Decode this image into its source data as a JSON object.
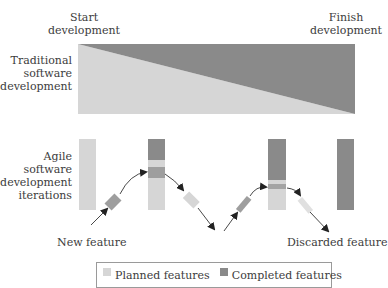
{
  "colors": {
    "planned": "#d6d6d6",
    "completed": "#8a8a8a",
    "arrow": "#333333",
    "legend_border": "#9a9a9a"
  },
  "labels": {
    "start": "Start\ndevelopment",
    "start_line1": "Start",
    "start_line2": "development",
    "finish_line1": "Finish",
    "finish_line2": "development",
    "traditional_line1": "Traditional",
    "traditional_line2": "software",
    "traditional_line3": "development",
    "agile_line1": "Agile",
    "agile_line2": "software",
    "agile_line3": "development",
    "agile_line4": "iterations",
    "new_feature": "New feature",
    "discarded_feature": "Discarded feature"
  },
  "legend": {
    "items": [
      {
        "label": "Planned features",
        "color": "#d6d6d6"
      },
      {
        "label": "Completed features",
        "color": "#8a8a8a"
      }
    ]
  },
  "traditional": {
    "box": {
      "x": 78,
      "y": 44,
      "w": 277,
      "h": 70
    },
    "description": "Completed work grows linearly from start to finish (dark triangle above diagonal)"
  },
  "agile": {
    "iterations": [
      {
        "x": 79,
        "segments": [
          {
            "type": "planned",
            "from": 139,
            "to": 210
          }
        ]
      },
      {
        "x": 148,
        "segments": [
          {
            "type": "completed",
            "from": 139,
            "to": 160
          },
          {
            "type": "planned",
            "from": 160,
            "to": 167
          },
          {
            "type": "completed",
            "from": 167,
            "to": 178
          },
          {
            "type": "planned",
            "from": 178,
            "to": 210
          }
        ]
      },
      {
        "x": 268,
        "segments": [
          {
            "type": "completed",
            "from": 139,
            "to": 180
          },
          {
            "type": "planned",
            "from": 180,
            "to": 184
          },
          {
            "type": "completed",
            "from": 184,
            "to": 189
          },
          {
            "type": "planned",
            "from": 189,
            "to": 210
          }
        ]
      },
      {
        "x": 337,
        "segments": [
          {
            "type": "completed",
            "from": 139,
            "to": 210
          }
        ]
      }
    ]
  }
}
